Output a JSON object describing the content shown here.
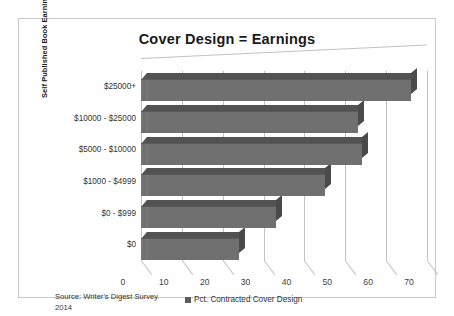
{
  "frame": {
    "border_color": "#c9c9c9"
  },
  "chart_data": {
    "type": "bar",
    "orientation": "horizontal",
    "title": "Cover Design = Earnings",
    "xlabel": "",
    "ylabel": "Self Published Book Earnings",
    "categories": [
      "$0",
      "$0 - $999",
      "$1000 - $4999",
      "$5000 - $10000",
      "$10000 - $25000",
      "$25000+"
    ],
    "values": [
      24,
      33,
      45,
      54,
      53,
      66
    ],
    "series": [
      {
        "name": "Pct. Contracted Cover Design",
        "values": [
          24,
          33,
          45,
          54,
          53,
          66
        ]
      }
    ],
    "xlim": [
      0,
      70
    ],
    "xticks": [
      0,
      10,
      20,
      30,
      40,
      50,
      60,
      70
    ],
    "xtick_labels": [
      "0",
      "10",
      "20",
      "30",
      "40",
      "50",
      "60",
      "70"
    ],
    "grid": true,
    "legend_position": "bottom",
    "bar_color": "#737373",
    "annotations": {
      "source": "Source: Writer's Digest Survey 2014"
    }
  },
  "legend": {
    "entries": [
      {
        "label": "Pct. Contracted Cover Design",
        "color": "#5c5c5c"
      }
    ]
  },
  "source": {
    "line1": "Source: Writer's Digest Survey",
    "line2": "2014"
  }
}
